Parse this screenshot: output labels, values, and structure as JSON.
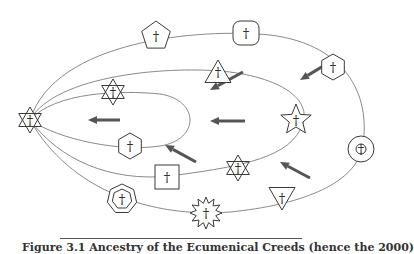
{
  "diagram": {
    "colors": {
      "orbit_stroke": "#8a8a8a",
      "symbol_stroke": "#3a3a3a",
      "arrow_fill": "#555555",
      "background": "#ffffff"
    },
    "origin_symbol": {
      "shape": "hexagram",
      "label": "†",
      "x": 30,
      "y": 120
    },
    "orbits": [
      {
        "name": "outer-orbit",
        "rx": 190,
        "ry": 92,
        "cx": 220,
        "cy": 125
      },
      {
        "name": "second-orbit",
        "rx": 156,
        "ry": 56,
        "cx": 186,
        "cy": 124
      },
      {
        "name": "third-orbit",
        "rx": 137,
        "ry": 38,
        "cx": 167,
        "cy": 118
      },
      {
        "name": "lower-orbit",
        "rx": 175,
        "ry": 60,
        "cx": 205,
        "cy": 148
      }
    ],
    "symbols": [
      {
        "name": "pentagon-cross",
        "shape": "pentagon",
        "label": "†",
        "x": 156,
        "y": 36
      },
      {
        "name": "rounded-square-cross",
        "shape": "rounded-square",
        "label": "†",
        "x": 246,
        "y": 33
      },
      {
        "name": "hexagon-cross-right",
        "shape": "hexagon",
        "label": "†",
        "x": 333,
        "y": 67
      },
      {
        "name": "triangle-cross",
        "shape": "triangle",
        "label": "†",
        "x": 218,
        "y": 72
      },
      {
        "name": "star-of-david-upper",
        "shape": "hexagram",
        "label": "†",
        "x": 113,
        "y": 92
      },
      {
        "name": "five-point-star-cross",
        "shape": "star5",
        "label": "†",
        "x": 296,
        "y": 120
      },
      {
        "name": "hexagon-cross-left",
        "shape": "hexagon",
        "label": "†",
        "x": 130,
        "y": 146
      },
      {
        "name": "circle-cross",
        "shape": "circle",
        "label": "†",
        "x": 361,
        "y": 149
      },
      {
        "name": "star-of-david-lower",
        "shape": "hexagram",
        "label": "†",
        "x": 238,
        "y": 168
      },
      {
        "name": "square-cross",
        "shape": "square",
        "label": "†",
        "x": 167,
        "y": 177
      },
      {
        "name": "triangle-down-cross",
        "shape": "triangle-down",
        "label": "†",
        "x": 282,
        "y": 198
      },
      {
        "name": "heptagon-cross",
        "shape": "heptagon",
        "label": "†",
        "x": 122,
        "y": 199
      },
      {
        "name": "twelve-point-star-cross",
        "shape": "star12",
        "label": "†",
        "x": 206,
        "y": 213
      }
    ],
    "arrows": [
      {
        "name": "arrow-upper-right",
        "from": [
          330,
          62
        ],
        "to": [
          300,
          80
        ]
      },
      {
        "name": "arrow-upper-mid",
        "from": [
          243,
          72
        ],
        "to": [
          210,
          90
        ]
      },
      {
        "name": "arrow-left-inner",
        "from": [
          120,
          120
        ],
        "to": [
          88,
          120
        ]
      },
      {
        "name": "arrow-left-mid",
        "from": [
          245,
          121
        ],
        "to": [
          210,
          121
        ]
      },
      {
        "name": "arrow-lower-mid",
        "from": [
          196,
          162
        ],
        "to": [
          165,
          145
        ]
      },
      {
        "name": "arrow-lower-right",
        "from": [
          310,
          178
        ],
        "to": [
          280,
          162
        ]
      }
    ]
  },
  "caption": {
    "text": "Figure 3.1 Ancestry of the Ecumenical Creeds (hence the 2000)"
  }
}
